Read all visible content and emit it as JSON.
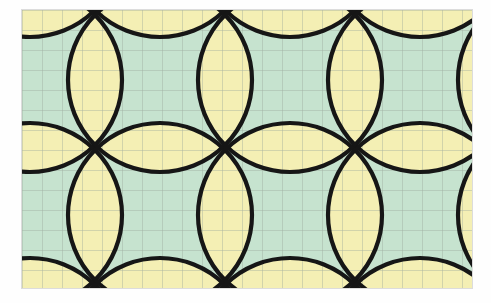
{
  "figure": {
    "kind": "geometric-tiling-illustration",
    "canvas": {
      "width": 491,
      "height": 303,
      "background": "#fefefe"
    },
    "panel": {
      "x": 22,
      "y": 10,
      "width": 450,
      "height": 278,
      "border_color": "#787878"
    }
  },
  "palette": {
    "page_background": "#fefefe",
    "field_green": "#c6e3cf",
    "petal_yellow": "#f4efb4",
    "outline_black": "#161616",
    "grid_line": "#9aa79c",
    "grid_line_yellow": "#c9c18a"
  },
  "geometry": {
    "lattice_spacing_x": 130,
    "lattice_spacing_y": 135,
    "circle_radius": 92,
    "circle_stroke_width": 4.2,
    "graph_grid_cell": 20,
    "graph_grid_stroke_width": 0.9,
    "node_origin_x": 8,
    "node_origin_y": 70,
    "columns": 5,
    "rows": 4,
    "visible_full_rosettes": 6,
    "description_of_motif": "four-petal rosette (quatrefoil) with concave square centre"
  },
  "chart_data": {
    "type": "diagram",
    "elements": [
      {
        "name": "circle-lattice",
        "count": 20,
        "radius": 92,
        "spacing": [
          130,
          135
        ]
      },
      {
        "name": "graph-paper-grid",
        "cell_size": 20
      },
      {
        "name": "yellow-lens-regions",
        "color": "#f4efb4"
      },
      {
        "name": "green-star-regions",
        "color": "#c6e3cf"
      }
    ]
  }
}
